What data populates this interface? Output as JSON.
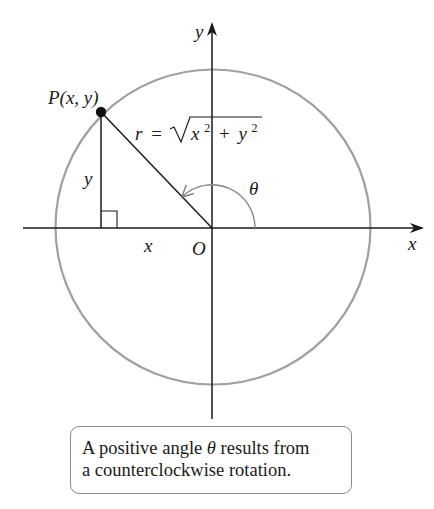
{
  "diagram": {
    "type": "unit-circle-angle-diagram",
    "colors": {
      "ink": "#1a1a1a",
      "circle": "#a0a0a0",
      "arc": "#8a8a8a",
      "caption_border": "#8a8a8a"
    },
    "axes": {
      "x_label": "x",
      "y_label": "y",
      "origin_label": "O"
    },
    "point": {
      "label": "P(x, y)"
    },
    "legs": {
      "horizontal_label": "x",
      "vertical_label": "y"
    },
    "radius_formula": {
      "lhs": "r",
      "equals": "=",
      "radical_base": "x",
      "exp1": "2",
      "plus": "+",
      "radical_second": "y",
      "exp2": "2"
    },
    "angle": {
      "label": "θ",
      "direction": "counterclockwise"
    },
    "caption": {
      "line1_before": "A positive angle ",
      "line1_theta": "θ",
      "line1_after": " results from",
      "line2": "a counterclockwise rotation."
    }
  }
}
